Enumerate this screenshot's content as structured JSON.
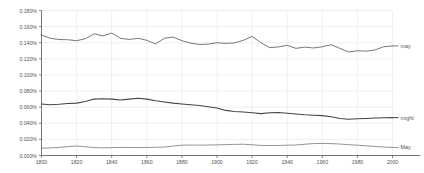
{
  "chart_data": {
    "type": "line",
    "title": "",
    "subtitle": "",
    "xlabel": "",
    "ylabel": "",
    "xlim": [
      1800,
      2000
    ],
    "ylim": [
      0.0,
      0.18
    ],
    "grid": true,
    "legend_position": "right-inline",
    "x_tick_labels": [
      "1800",
      "1820",
      "1840",
      "1860",
      "1880",
      "1900",
      "1920",
      "1940",
      "1960",
      "1980",
      "2000"
    ],
    "x_ticks": [
      1800,
      1820,
      1840,
      1860,
      1880,
      1900,
      1920,
      1940,
      1960,
      1980,
      2000
    ],
    "y_tick_labels": [
      "0.000%",
      "0.020%",
      "0.040%",
      "0.060%",
      "0.080%",
      "0.100%",
      "0.120%",
      "0.140%",
      "0.160%",
      "0.180%"
    ],
    "y_ticks": [
      0.0,
      0.02,
      0.04,
      0.06,
      0.08,
      0.1,
      0.12,
      0.14,
      0.16,
      0.18
    ],
    "x": [
      1800,
      1805,
      1810,
      1815,
      1820,
      1825,
      1830,
      1835,
      1840,
      1845,
      1850,
      1855,
      1860,
      1865,
      1870,
      1875,
      1880,
      1885,
      1890,
      1895,
      1900,
      1905,
      1910,
      1915,
      1920,
      1925,
      1930,
      1935,
      1940,
      1945,
      1950,
      1955,
      1960,
      1965,
      1970,
      1975,
      1980,
      1985,
      1990,
      1995,
      2000
    ],
    "series": [
      {
        "name": "may",
        "label": "may",
        "color": "#555555",
        "values": [
          0.1495,
          0.1455,
          0.144,
          0.1437,
          0.1425,
          0.145,
          0.151,
          0.1485,
          0.152,
          0.1455,
          0.144,
          0.1455,
          0.143,
          0.1385,
          0.1455,
          0.147,
          0.1425,
          0.1395,
          0.1378,
          0.1382,
          0.14,
          0.1392,
          0.1398,
          0.143,
          0.1478,
          0.14,
          0.134,
          0.1348,
          0.1368,
          0.133,
          0.1345,
          0.1335,
          0.135,
          0.1375,
          0.133,
          0.1285,
          0.13,
          0.1295,
          0.131,
          0.135,
          0.136
        ]
      },
      {
        "name": "might",
        "label": "might",
        "color": "#444444",
        "values": [
          0.064,
          0.063,
          0.0635,
          0.0645,
          0.065,
          0.067,
          0.07,
          0.0705,
          0.07,
          0.069,
          0.07,
          0.071,
          0.07,
          0.068,
          0.0665,
          0.065,
          0.064,
          0.063,
          0.062,
          0.0605,
          0.059,
          0.056,
          0.0545,
          0.054,
          0.053,
          0.052,
          0.053,
          0.0535,
          0.0525,
          0.0515,
          0.0505,
          0.05,
          0.0495,
          0.048,
          0.046,
          0.045,
          0.0455,
          0.046,
          0.0465,
          0.0468,
          0.047
        ]
      },
      {
        "name": "May",
        "label": "May",
        "color": "#777777",
        "values": [
          0.009,
          0.0095,
          0.01,
          0.011,
          0.0118,
          0.0108,
          0.0098,
          0.0095,
          0.0098,
          0.01,
          0.01,
          0.0098,
          0.01,
          0.0102,
          0.0105,
          0.0118,
          0.0128,
          0.013,
          0.0128,
          0.013,
          0.0132,
          0.0135,
          0.0138,
          0.014,
          0.0133,
          0.0125,
          0.0123,
          0.0125,
          0.0128,
          0.013,
          0.014,
          0.0148,
          0.015,
          0.0148,
          0.0142,
          0.0135,
          0.0128,
          0.012,
          0.0112,
          0.0105,
          0.01
        ]
      }
    ]
  }
}
